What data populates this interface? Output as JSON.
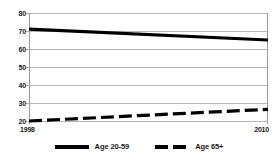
{
  "chart_data": {
    "type": "line",
    "title": "",
    "xlabel": "",
    "ylabel": "",
    "x": [
      1998,
      2010
    ],
    "xlim": [
      1998,
      2010
    ],
    "ylim": [
      20,
      80
    ],
    "yticks": [
      20,
      30,
      40,
      50,
      60,
      70,
      80
    ],
    "xticks": [
      1998,
      2010
    ],
    "xtick_labels": [
      "1998",
      "2010"
    ],
    "ytick_labels": [
      "20",
      "30",
      "40",
      "50",
      "60",
      "70",
      "80"
    ],
    "grid": true,
    "grid_axis": "y",
    "legend_position": "bottom",
    "series": [
      {
        "name": "Age 20-59",
        "style": "solid",
        "color": "#000000",
        "values": [
          71,
          65
        ]
      },
      {
        "name": "Age 65+",
        "style": "dashed",
        "color": "#000000",
        "values": [
          20,
          26.5
        ]
      }
    ]
  },
  "axis": {
    "y_labels": [
      "80",
      "70",
      "60",
      "50",
      "40",
      "30",
      "20"
    ],
    "x_label_start": "1998",
    "x_label_end": "2010"
  },
  "legend": {
    "items": [
      {
        "label": "Age 20-59",
        "swatch": "solid-line-swatch"
      },
      {
        "label": "Age 65+",
        "swatch": "dashed-line-swatch"
      }
    ]
  },
  "colors": {
    "series": "#000000",
    "grid": "#b5b5b5",
    "axis": "#9a9a9a",
    "text": "#1a1a1a",
    "background": "#ffffff"
  }
}
